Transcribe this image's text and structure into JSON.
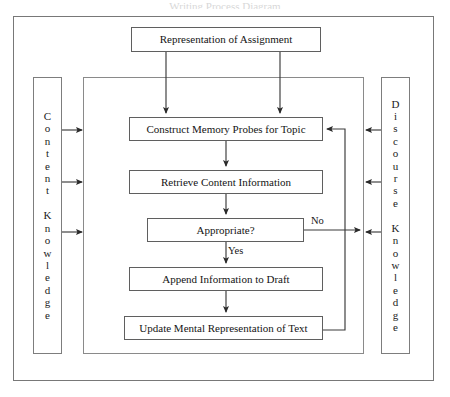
{
  "diagram": {
    "title_fragment": "Writing Process Diagram",
    "outer_container_name": "Writing Process Model",
    "nodes": {
      "representation": "Representation of Assignment",
      "construct": "Construct Memory Probes for Topic",
      "retrieve": "Retrieve Content Information",
      "appropriate": "Appropriate?",
      "append": "Append Information to Draft",
      "update": "Update Mental Representation of Text"
    },
    "side_panels": {
      "left": "Content Knowledge",
      "right": "Discourse Knowledge"
    },
    "edge_labels": {
      "no": "No",
      "yes": "Yes"
    },
    "colors": {
      "box_border": "#5f6a6a",
      "frame_border": "#787878",
      "text": "#141414",
      "background": "#ffffff",
      "arrow": "#2a2a2a"
    },
    "flow_sequence": [
      "Representation of Assignment",
      "Construct Memory Probes for Topic",
      "Retrieve Content Information",
      "Appropriate?",
      "Append Information to Draft",
      "Update Mental Representation of Text"
    ]
  }
}
